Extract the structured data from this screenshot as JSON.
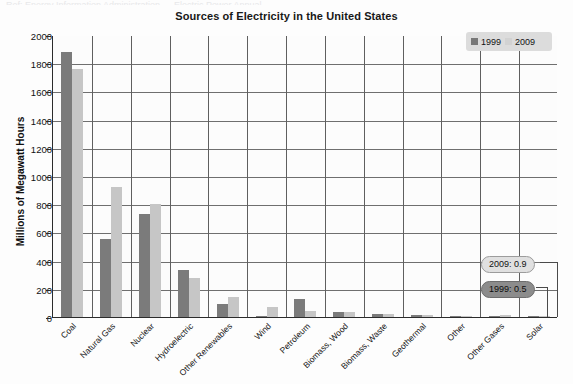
{
  "top_sliver_text": "Ref: Energy Information Administration — Electric Power Annual",
  "chart": {
    "title": "Sources of Electricity in the United States",
    "y_axis_title": "Millions of Megawatt Hours"
  },
  "legend": {
    "items": [
      {
        "label": "1999",
        "swatch": "legend-swatch-1999",
        "color": "#787878"
      },
      {
        "label": "2009",
        "swatch": "legend-swatch-2009",
        "color": "#d2d2d2"
      }
    ]
  },
  "callouts": [
    {
      "name": "callout-2009",
      "text": "2009: 0.9"
    },
    {
      "name": "callout-1999",
      "text": "1999: 0.5"
    }
  ],
  "chart_data": {
    "type": "bar",
    "title": "Sources of Electricity in the United States",
    "xlabel": "",
    "ylabel": "Millions of Megawatt Hours",
    "ylim": [
      0,
      2000
    ],
    "yticks": [
      0,
      200,
      400,
      600,
      800,
      1000,
      1200,
      1400,
      1600,
      1800,
      2000
    ],
    "grid": true,
    "legend_position": "top-right",
    "categories": [
      "Coal",
      "Natural Gas",
      "Nuclear",
      "Hydroelectric",
      "Other Renewables",
      "Wind",
      "Petroleum",
      "Biomass, Wood",
      "Biomass, Waste",
      "Geothermal",
      "Other",
      "Other Gases",
      "Solar"
    ],
    "series": [
      {
        "name": "1999",
        "color": "#7b7b7b",
        "values": [
          1880,
          550,
          730,
          330,
          90,
          5,
          130,
          37,
          22,
          15,
          5,
          0.5,
          0.5
        ]
      },
      {
        "name": "2009",
        "color": "#c6c6c6",
        "values": [
          1760,
          920,
          800,
          275,
          145,
          74,
          40,
          37,
          18,
          15,
          5,
          11,
          0.9
        ]
      }
    ],
    "annotations": [
      {
        "label": "2009: 0.9",
        "series": "2009",
        "category": "Solar",
        "value": 0.9
      },
      {
        "label": "1999: 0.5",
        "series": "1999",
        "category": "Solar",
        "value": 0.5
      }
    ]
  }
}
